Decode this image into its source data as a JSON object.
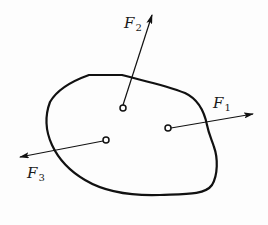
{
  "diagram": {
    "type": "free-body force diagram",
    "body": {
      "shape": "irregular closed outline (rigid body)"
    },
    "forces": [
      {
        "id": "F1",
        "symbol": "F",
        "subscript": "1",
        "application_point": [
          168,
          128
        ],
        "arrow_tip": [
          253,
          114
        ],
        "direction": "right, slightly upward"
      },
      {
        "id": "F2",
        "symbol": "F",
        "subscript": "2",
        "application_point": [
          123,
          108
        ],
        "arrow_tip": [
          152,
          15
        ],
        "direction": "up, slightly right"
      },
      {
        "id": "F3",
        "symbol": "F",
        "subscript": "3",
        "application_point": [
          106,
          140
        ],
        "arrow_tip": [
          20,
          157
        ],
        "direction": "left, slightly downward"
      }
    ],
    "colors": {
      "stroke": "#111111",
      "background": "#fdfdfd"
    }
  }
}
